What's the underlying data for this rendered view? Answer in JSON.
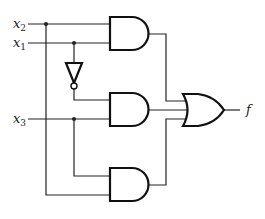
{
  "diagram": {
    "type": "logic-circuit",
    "inputs": [
      {
        "name": "x",
        "sub": "2"
      },
      {
        "name": "x",
        "sub": "1"
      },
      {
        "name": "x",
        "sub": "3"
      }
    ],
    "output": {
      "name": "f"
    },
    "gates": [
      {
        "id": "and1",
        "type": "AND",
        "inputs": [
          "x2",
          "x1"
        ]
      },
      {
        "id": "not1",
        "type": "NOT",
        "inputs": [
          "x1"
        ]
      },
      {
        "id": "and2",
        "type": "AND",
        "inputs": [
          "not x1",
          "x3"
        ]
      },
      {
        "id": "and3",
        "type": "AND",
        "inputs": [
          "x3",
          "x2"
        ]
      },
      {
        "id": "or1",
        "type": "OR",
        "inputs": [
          "and1",
          "and2",
          "and3"
        ],
        "output": "f"
      }
    ],
    "colors": {
      "line": "#222222",
      "background": "#ffffff"
    }
  }
}
